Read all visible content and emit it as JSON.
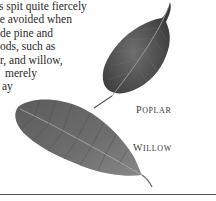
{
  "body_text": {
    "lines": [
      "s spit quite fiercely",
      "be avoided when",
      "de pine and",
      "ods, such as",
      "r, and willow,",
      "merely",
      "ay"
    ]
  },
  "figures": [
    {
      "name": "poplar",
      "caption_first": "P",
      "caption_rest": "oplar",
      "color": "#5a5a5a"
    },
    {
      "name": "willow",
      "caption_first": "W",
      "caption_rest": "illow",
      "color": "#6b6b6b"
    }
  ]
}
